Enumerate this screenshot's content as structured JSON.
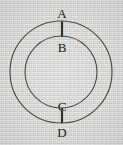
{
  "figure": {
    "type": "geometry-diagram",
    "width": 123,
    "height": 145,
    "background_color": "#d6d6d4",
    "stroke_color": "#44423f",
    "segment_color": "#26241f",
    "label_color": "#232119"
  },
  "geometry": {
    "center": {
      "x": 61,
      "y": 72
    },
    "circles": [
      {
        "name": "outer-circle",
        "cx": 61,
        "cy": 72,
        "r": 51
      },
      {
        "name": "inner-circle",
        "cx": 61,
        "cy": 72,
        "r": 36
      }
    ],
    "segments": [
      {
        "name": "segment-ab",
        "x": 62,
        "y1": 21.5,
        "y2": 37.0,
        "from": "A",
        "to": "B"
      },
      {
        "name": "segment-cd",
        "x": 62,
        "y1": 108.0,
        "y2": 123.0,
        "from": "C",
        "to": "D"
      }
    ]
  },
  "labels": [
    {
      "id": "A",
      "text": "A",
      "x": 54,
      "y": 7
    },
    {
      "id": "B",
      "text": "B",
      "x": 54,
      "y": 41
    },
    {
      "id": "C",
      "text": "C",
      "x": 54,
      "y": 100
    },
    {
      "id": "D",
      "text": "D",
      "x": 54,
      "y": 126
    }
  ]
}
